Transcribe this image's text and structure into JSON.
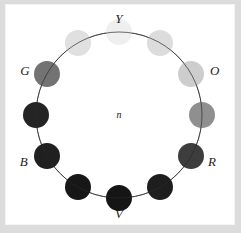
{
  "figure": {
    "type": "hue-circle-diagram",
    "background_color": "#ffffff",
    "frame_color": "#dcdcdc",
    "center_label": "n"
  },
  "chart_data": {
    "type": "scatter",
    "title": "",
    "subtitle": "",
    "xlabel": "",
    "ylabel": "",
    "grid": false,
    "legend_position": "none",
    "layout": "polar-ring",
    "center_annotation": "n",
    "ring": {
      "center_x": 119,
      "center_y": 115,
      "radius": 83,
      "stroke_color": "#555555",
      "stroke_width": 0.8
    },
    "annotations": [
      {
        "text": "Y",
        "x": 119,
        "y": 18,
        "angle_deg": 90,
        "anchor": "center"
      },
      {
        "text": "O",
        "x": 210,
        "y": 70,
        "angle_deg": 30,
        "anchor": "left"
      },
      {
        "text": "R",
        "x": 208,
        "y": 161,
        "angle_deg": -30,
        "anchor": "left"
      },
      {
        "text": "V",
        "x": 119,
        "y": 213,
        "angle_deg": -90,
        "anchor": "center"
      },
      {
        "text": "B",
        "x": 28,
        "y": 161,
        "angle_deg": -150,
        "anchor": "right"
      },
      {
        "text": "G",
        "x": 30,
        "y": 70,
        "angle_deg": 150,
        "anchor": "right"
      }
    ],
    "categories": [
      "Y",
      "Y-O",
      "O",
      "O-R",
      "R",
      "R-V",
      "V",
      "V-B",
      "B",
      "B-G",
      "G",
      "G-Y"
    ],
    "values": [
      0.94,
      0.86,
      0.8,
      0.56,
      0.24,
      0.12,
      0.08,
      0.09,
      0.13,
      0.15,
      0.45,
      0.88
    ],
    "points": [
      {
        "label": "Y",
        "angle_deg": 90,
        "radius": 83,
        "cx": 119,
        "cy": 32,
        "r": 13,
        "fill": "#efefef",
        "luminance": 0.94
      },
      {
        "label": "Y-O",
        "angle_deg": 60,
        "radius": 83,
        "cx": 160,
        "cy": 43,
        "r": 13,
        "fill": "#dcdcdc",
        "luminance": 0.86
      },
      {
        "label": "O",
        "angle_deg": 30,
        "radius": 83,
        "cx": 191,
        "cy": 74,
        "r": 13,
        "fill": "#cdcdcd",
        "luminance": 0.8
      },
      {
        "label": "O-R",
        "angle_deg": 0,
        "radius": 83,
        "cx": 202,
        "cy": 115,
        "r": 13,
        "fill": "#8f8f8f",
        "luminance": 0.56
      },
      {
        "label": "R",
        "angle_deg": -30,
        "radius": 83,
        "cx": 191,
        "cy": 156,
        "r": 13,
        "fill": "#3d3d3d",
        "luminance": 0.24
      },
      {
        "label": "R-V",
        "angle_deg": -60,
        "radius": 83,
        "cx": 160,
        "cy": 187,
        "r": 13,
        "fill": "#1e1e1e",
        "luminance": 0.12
      },
      {
        "label": "V",
        "angle_deg": -90,
        "radius": 83,
        "cx": 119,
        "cy": 198,
        "r": 13,
        "fill": "#151515",
        "luminance": 0.08
      },
      {
        "label": "V-B",
        "angle_deg": -120,
        "radius": 83,
        "cx": 78,
        "cy": 187,
        "r": 13,
        "fill": "#171717",
        "luminance": 0.09
      },
      {
        "label": "B",
        "angle_deg": -150,
        "radius": 83,
        "cx": 47,
        "cy": 156,
        "r": 13,
        "fill": "#202020",
        "luminance": 0.13
      },
      {
        "label": "B-G",
        "angle_deg": 180,
        "radius": 83,
        "cx": 36,
        "cy": 115,
        "r": 13,
        "fill": "#242424",
        "luminance": 0.15
      },
      {
        "label": "G",
        "angle_deg": 150,
        "radius": 83,
        "cx": 47,
        "cy": 74,
        "r": 13,
        "fill": "#737373",
        "luminance": 0.45
      },
      {
        "label": "G-Y",
        "angle_deg": 120,
        "radius": 83,
        "cx": 78,
        "cy": 43,
        "r": 13,
        "fill": "#e0e0e0",
        "luminance": 0.88
      }
    ]
  }
}
